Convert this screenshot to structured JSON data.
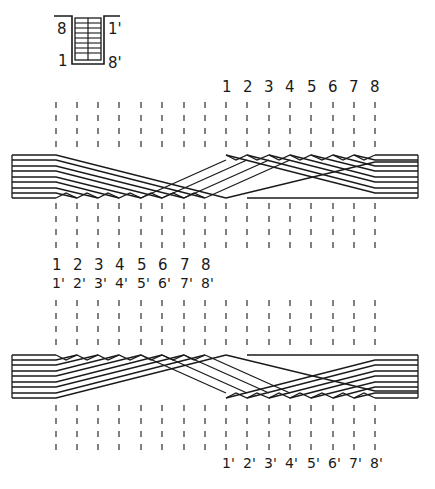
{
  "legend_icon": {
    "top_left_label": "8",
    "top_right_label": "1'",
    "bottom_left_label": "1",
    "bottom_right_label": "8'",
    "strand_rows": 8,
    "columns": 2
  },
  "top_diagram": {
    "position_labels": [
      "1",
      "2",
      "3",
      "4",
      "5",
      "6",
      "7",
      "8"
    ],
    "strand_count": 8,
    "dashed_line_count": 16,
    "bottom_labels": [],
    "bottom_labels_secondary": []
  },
  "middle_labels": {
    "primary": [
      "1",
      "2",
      "3",
      "4",
      "5",
      "6",
      "7",
      "8"
    ],
    "primed": [
      "1'",
      "2'",
      "3'",
      "4'",
      "5'",
      "6'",
      "7'",
      "8'"
    ]
  },
  "bottom_diagram": {
    "strand_count": 8,
    "dashed_line_count": 16,
    "position_labels": [
      "1'",
      "2'",
      "3'",
      "4'",
      "5'",
      "6'",
      "7'",
      "8'"
    ]
  },
  "colors": {
    "ink": "#1a1a1a",
    "background": "#ffffff"
  }
}
